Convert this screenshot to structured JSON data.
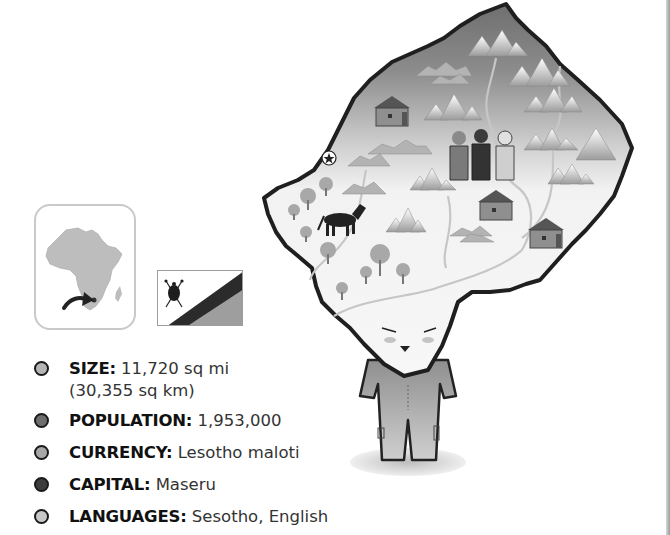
{
  "country": "Lesotho",
  "facts": [
    {
      "label": "SIZE:",
      "value": "11,720 sq mi",
      "value2": "(30,355 sq km)",
      "bullet_color": "#b5b5b5"
    },
    {
      "label": "POPULATION:",
      "value": "1,953,000",
      "bullet_color": "#6e6e6e"
    },
    {
      "label": "CURRENCY:",
      "value": "Lesotho maloti",
      "bullet_color": "#a8a8a8"
    },
    {
      "label": "CAPITAL:",
      "value": "Maseru",
      "bullet_color": "#3c3c3c"
    },
    {
      "label": "LANGUAGES:",
      "value": "Sesotho, English",
      "bullet_color": "#c8c8c8"
    }
  ],
  "icons": {
    "locator": "africa-locator-map-icon",
    "flag": "lesotho-flag-icon",
    "capital": "star-capital-icon",
    "map": "lesotho-character-map"
  },
  "colors": {
    "map_outline": "#222222",
    "mountain_region": "#8a8a8a",
    "lowland_region": "#f1f1f1",
    "river": "#c9c9c9",
    "tree": "#a9a9a9"
  }
}
